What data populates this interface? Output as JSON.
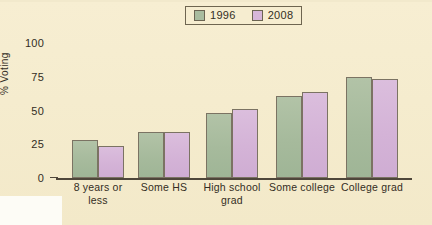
{
  "chart_data": {
    "type": "bar",
    "title": "",
    "xlabel": "",
    "ylabel": "% Voting",
    "ylim": [
      0,
      100
    ],
    "yticks": [
      0,
      25,
      50,
      75,
      100
    ],
    "ytick_labels": [
      "0",
      "25",
      "50",
      "75",
      "100"
    ],
    "grid": false,
    "legend_position": "top-center",
    "categories": [
      "8 years or less",
      "Some HS",
      "High school grad",
      "Some college",
      "College grad"
    ],
    "category_lines": [
      [
        "8 years or",
        "less"
      ],
      [
        "Some HS"
      ],
      [
        "High school",
        "grad"
      ],
      [
        "Some college"
      ],
      [
        "College grad"
      ]
    ],
    "series": [
      {
        "name": "1996",
        "color": "#a9bc9f",
        "values": [
          28,
          34,
          48,
          61,
          75
        ]
      },
      {
        "name": "2008",
        "color": "#d6b6d9",
        "values": [
          24,
          34,
          51,
          64,
          73
        ]
      }
    ]
  },
  "legend": {
    "items": [
      {
        "label": "1996",
        "color": "#a9bc9f"
      },
      {
        "label": "2008",
        "color": "#d6b6d9"
      }
    ]
  },
  "axes": {
    "y_title": "% Voting"
  },
  "colors": {
    "background": "#f5ecce",
    "axis": "#4e463a",
    "text": "#332d24",
    "bar_1996": "#a9bc9f",
    "bar_2008": "#d6b6d9",
    "bar_outline": "#7b7363"
  }
}
